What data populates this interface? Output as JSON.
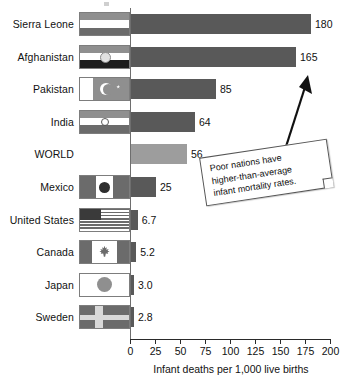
{
  "chart_data": {
    "type": "bar",
    "orientation": "horizontal",
    "title": "",
    "xlabel": "Infant deaths per 1,000 live births",
    "ylabel": "",
    "xlim": [
      0,
      200
    ],
    "xticks": [
      0,
      25,
      50,
      75,
      100,
      125,
      150,
      175,
      200
    ],
    "grid": false,
    "legend": null,
    "categories": [
      "Sierra Leone",
      "Afghanistan",
      "Pakistan",
      "India",
      "WORLD",
      "Mexico",
      "United States",
      "Canada",
      "Japan",
      "Sweden"
    ],
    "values": [
      180,
      165,
      85,
      64,
      56,
      25,
      6.7,
      5.2,
      3.0,
      2.8
    ],
    "value_labels": [
      "180",
      "165",
      "85",
      "64",
      "56",
      "25",
      "6.7",
      "5.2",
      "3.0",
      "2.8"
    ],
    "highlight_category": "WORLD",
    "annotations": [
      {
        "text": "Poor nations have higher-than-average infant mortality rates.",
        "lines": [
          "Poor nations have",
          "higher-than-average",
          "infant mortality rates."
        ],
        "points_to": "Afghanistan"
      }
    ],
    "colors": {
      "bar": "#595959",
      "bar_highlight": "#9d9d9d",
      "axis": "#2a2a2a",
      "text": "#111111",
      "callout_background": "#ffffff",
      "callout_border": "#555555"
    }
  },
  "flags": [
    {
      "country": "Sierra Leone",
      "icon": "flag-sierra-leone"
    },
    {
      "country": "Afghanistan",
      "icon": "flag-afghanistan"
    },
    {
      "country": "Pakistan",
      "icon": "flag-pakistan"
    },
    {
      "country": "India",
      "icon": "flag-india"
    },
    {
      "country": "WORLD",
      "icon": "none"
    },
    {
      "country": "Mexico",
      "icon": "flag-mexico"
    },
    {
      "country": "United States",
      "icon": "flag-united-states"
    },
    {
      "country": "Canada",
      "icon": "flag-canada"
    },
    {
      "country": "Japan",
      "icon": "flag-japan"
    },
    {
      "country": "Sweden",
      "icon": "flag-sweden"
    }
  ]
}
